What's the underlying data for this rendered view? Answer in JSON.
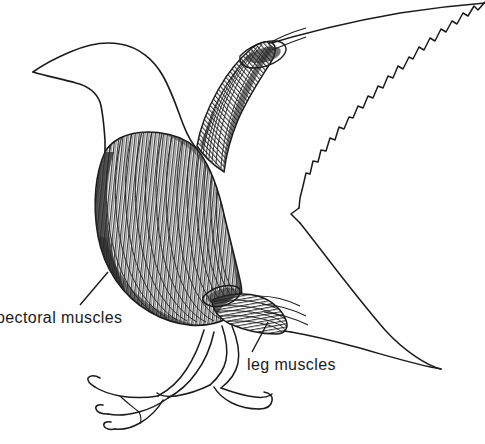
{
  "figure": {
    "type": "anatomical-line-diagram",
    "background_color": "#fefefe",
    "ink_color": "#1b1b1b",
    "title_fragment": "les",
    "labels": [
      {
        "id": "pectoral",
        "text": "pectoral muscles",
        "leader_line": {
          "x1": 80,
          "y1": 305,
          "x2": 108,
          "y2": 272
        }
      },
      {
        "id": "leg",
        "text": "leg muscles",
        "leader_line": {
          "x1": 252,
          "y1": 352,
          "x2": 268,
          "y2": 322
        }
      }
    ]
  }
}
